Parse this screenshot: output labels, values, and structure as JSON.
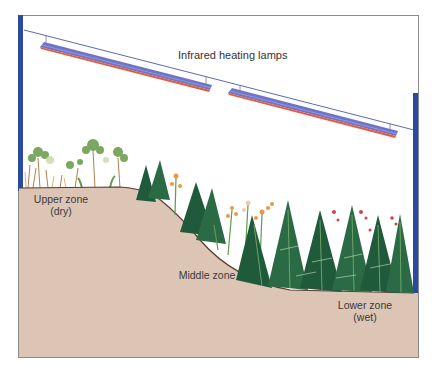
{
  "diagram": {
    "title": "Infrared heating lamps",
    "zones": [
      {
        "id": "upper",
        "line1": "Upper zone",
        "line2": "(dry)"
      },
      {
        "id": "middle",
        "line1": "Middle zone",
        "line2": ""
      },
      {
        "id": "lower",
        "line1": "Lower zone",
        "line2": "(wet)"
      }
    ],
    "components": {
      "lamps": [
        {
          "name": "lamp-1",
          "start": [
            40,
            45
          ],
          "end": [
            212,
            88
          ]
        },
        {
          "name": "lamp-2",
          "start": [
            228,
            92
          ],
          "end": [
            398,
            136
          ]
        }
      ],
      "support_wire": {
        "start": [
          24,
          30
        ],
        "end": [
          414,
          130
        ]
      },
      "vegetation": [
        "small shrubs and grasses (upper zone)",
        "conifers and flowering plants (middle zone)",
        "dense ferns and red berries (lower zone)"
      ]
    },
    "colors": {
      "frame_post": "#2a4aa0",
      "frame_border": "#8a8a8a",
      "wire": "#5a6ab0",
      "lamp_top": "#6f75c4",
      "lamp_bottom": "#e8583c",
      "soil": "#dcc5b4",
      "soil_edge": "#5a3a28",
      "fern_dark": "#1f5a3a",
      "fern_light": "#5f9a50",
      "flower_orange": "#e89a48",
      "berry_red": "#d8404a"
    }
  }
}
